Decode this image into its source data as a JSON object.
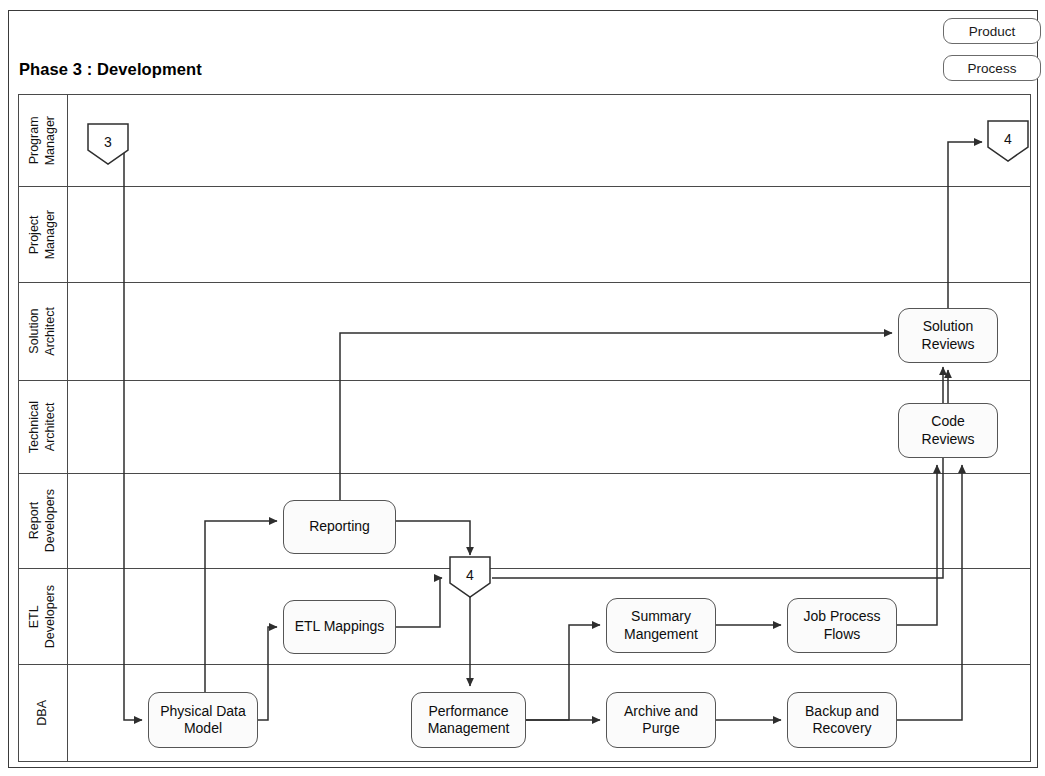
{
  "document": {
    "title": "Phase 3 : Development"
  },
  "legend": {
    "items": [
      {
        "label": "Product",
        "name": "legend-chip-product"
      },
      {
        "label": "Process",
        "name": "legend-chip-process"
      }
    ]
  },
  "lanes": [
    {
      "id": "program-manager",
      "label": "Program\nManager",
      "top": 0,
      "height": 92
    },
    {
      "id": "project-manager",
      "label": "Project\nManager",
      "top": 92,
      "height": 96
    },
    {
      "id": "solution-architect",
      "label": "Solution\nArchitect",
      "top": 188,
      "height": 98
    },
    {
      "id": "technical-architect",
      "label": "Technical\nArchitect",
      "top": 286,
      "height": 93
    },
    {
      "id": "report-developers",
      "label": "Report\nDevelopers",
      "top": 379,
      "height": 95
    },
    {
      "id": "etl-developers",
      "label": "ETL\nDevelopers",
      "top": 474,
      "height": 96
    },
    {
      "id": "dba",
      "label": "DBA",
      "top": 570,
      "height": 98
    }
  ],
  "nodes": [
    {
      "id": "solution-reviews",
      "label": "Solution\nReviews",
      "x": 898,
      "y": 308,
      "w": 100,
      "h": 55,
      "lane": "solution-architect"
    },
    {
      "id": "code-reviews",
      "label": "Code\nReviews",
      "x": 898,
      "y": 403,
      "w": 100,
      "h": 55,
      "lane": "technical-architect"
    },
    {
      "id": "reporting",
      "label": "Reporting",
      "x": 283,
      "y": 500,
      "w": 113,
      "h": 54,
      "lane": "report-developers"
    },
    {
      "id": "etl-mappings",
      "label": "ETL Mappings",
      "x": 283,
      "y": 600,
      "w": 113,
      "h": 54,
      "lane": "etl-developers"
    },
    {
      "id": "summary-mangement",
      "label": "Summary\nMangement",
      "x": 606,
      "y": 598,
      "w": 110,
      "h": 55,
      "lane": "etl-developers"
    },
    {
      "id": "job-process-flows",
      "label": "Job Process\nFlows",
      "x": 787,
      "y": 598,
      "w": 110,
      "h": 55,
      "lane": "etl-developers"
    },
    {
      "id": "physical-data-model",
      "label": "Physical Data\nModel",
      "x": 148,
      "y": 692,
      "w": 110,
      "h": 56,
      "lane": "dba"
    },
    {
      "id": "performance-management",
      "label": "Performance\nManagement",
      "x": 411,
      "y": 692,
      "w": 115,
      "h": 56,
      "lane": "dba"
    },
    {
      "id": "archive-and-purge",
      "label": "Archive and\nPurge",
      "x": 606,
      "y": 692,
      "w": 110,
      "h": 56,
      "lane": "dba"
    },
    {
      "id": "backup-and-recovery",
      "label": "Backup and\nRecovery",
      "x": 787,
      "y": 692,
      "w": 110,
      "h": 56,
      "lane": "dba"
    }
  ],
  "connectors": [
    {
      "id": "connector-in-3",
      "label": "3",
      "x": 84,
      "y": 120,
      "lane": "program-manager",
      "direction": "in"
    },
    {
      "id": "connector-out-4",
      "label": "4",
      "x": 988,
      "y": 117,
      "lane": "program-manager",
      "direction": "out"
    },
    {
      "id": "connector-mid-4",
      "label": "4",
      "x": 448,
      "y": 561,
      "lane": "etl-developers",
      "direction": "junction"
    }
  ],
  "flows": [
    {
      "from": "connector-in-3",
      "to": "physical-data-model"
    },
    {
      "from": "physical-data-model",
      "to": "reporting"
    },
    {
      "from": "physical-data-model",
      "to": "etl-mappings"
    },
    {
      "from": "reporting",
      "to": "connector-mid-4"
    },
    {
      "from": "reporting",
      "to": "solution-reviews"
    },
    {
      "from": "etl-mappings",
      "to": "connector-mid-4"
    },
    {
      "from": "connector-mid-4",
      "to": "performance-management"
    },
    {
      "from": "connector-mid-4",
      "to": "solution-reviews"
    },
    {
      "from": "performance-management",
      "to": "summary-mangement"
    },
    {
      "from": "performance-management",
      "to": "archive-and-purge"
    },
    {
      "from": "summary-mangement",
      "to": "job-process-flows"
    },
    {
      "from": "archive-and-purge",
      "to": "backup-and-recovery"
    },
    {
      "from": "job-process-flows",
      "to": "code-reviews"
    },
    {
      "from": "backup-and-recovery",
      "to": "code-reviews"
    },
    {
      "from": "code-reviews",
      "to": "solution-reviews"
    },
    {
      "from": "solution-reviews",
      "to": "connector-out-4"
    }
  ],
  "style": {
    "line_color": "#2e2e2e",
    "border_color": "#4a4a4a",
    "node_fill": "#fbfbfb",
    "background": "#ffffff"
  }
}
